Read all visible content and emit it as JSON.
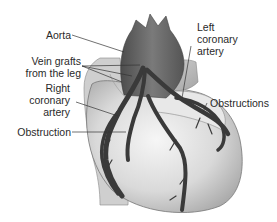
{
  "figure": {
    "labels": {
      "aorta": "Aorta",
      "vein_grafts_line1": "Vein grafts",
      "vein_grafts_line2": "from the leg",
      "right_coronary_line1": "Right",
      "right_coronary_line2": "coronary",
      "right_coronary_line3": "artery",
      "obstruction": "Obstruction",
      "left_coronary_line1": "Left",
      "left_coronary_line2": "coronary",
      "left_coronary_line3": "artery",
      "obstructions": "Obstructions"
    },
    "colors": {
      "background": "#ffffff",
      "heart_light": "#e4e4e4",
      "heart_mid": "#bdbdbd",
      "aorta": "#6a6a6a",
      "vessels": "#3a3a3a",
      "leader_lines": "#333333"
    }
  }
}
